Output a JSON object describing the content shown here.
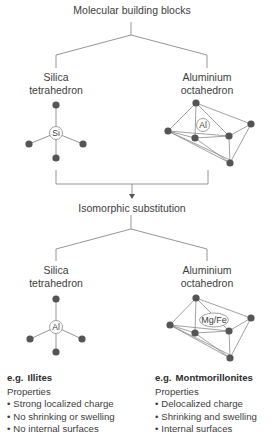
{
  "top_title": "Molecular building blocks",
  "middle_title": "Isomorphic substitution",
  "row1": {
    "left": {
      "line1": "Silica",
      "line2": "tetrahedron",
      "center_atom": "Si"
    },
    "right": {
      "line1": "Aluminium",
      "line2": "octahedron",
      "center_atom": "Al"
    }
  },
  "row2": {
    "left": {
      "line1": "Silica",
      "line2": "tetrahedron",
      "center_atom": "Al"
    },
    "right": {
      "line1": "Aluminium",
      "line2": "octahedron",
      "center_atom": "Mg/Fe"
    }
  },
  "examples": {
    "left": {
      "eg": "e.g.",
      "name": "Illites",
      "heading": "Properties",
      "items": [
        "Strong localized charge",
        "No shrinking or swelling",
        "No internal surfaces"
      ]
    },
    "right": {
      "eg": "e.g.",
      "name": "Montmorillonites",
      "heading": "Properties",
      "items": [
        "Delocalized charge",
        "Shrinking and swelling",
        "Internal surfaces"
      ]
    }
  },
  "colors": {
    "line": "#8a8a8a",
    "node": "#555555",
    "text": "#3d3d3d"
  }
}
